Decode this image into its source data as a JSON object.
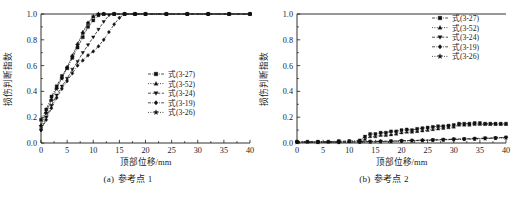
{
  "figure": {
    "panels": [
      {
        "id": "panel-a",
        "caption_tag": "(a)",
        "caption_text": "参考点 1",
        "chart_data": {
          "type": "line",
          "title": "",
          "xlabel": "顶部位移/mm",
          "ylabel": "损伤判断指数",
          "xlim": [
            0,
            40
          ],
          "ylim": [
            0.0,
            1.0
          ],
          "xticks": [
            0,
            5,
            10,
            15,
            20,
            25,
            30,
            35,
            40
          ],
          "yticks": [
            0.0,
            0.2,
            0.4,
            0.6,
            0.8,
            1.0
          ],
          "xtick_labels": [
            "0",
            "5",
            "10",
            "15",
            "20",
            "25",
            "30",
            "35",
            "40"
          ],
          "ytick_labels": [
            "0.0",
            "0.2",
            "0.4",
            "0.6",
            "0.8",
            "1.0"
          ],
          "grid": false,
          "legend_position": "center-right",
          "series": [
            {
              "name": "式(3-27)",
              "marker": "square",
              "linestyle": "dash-dot",
              "x": [
                0,
                1,
                2,
                3,
                4,
                5,
                6,
                7,
                8,
                9,
                10,
                11,
                12,
                14,
                16,
                18,
                20,
                24,
                28,
                32,
                36,
                40
              ],
              "y": [
                0.18,
                0.26,
                0.36,
                0.44,
                0.52,
                0.58,
                0.66,
                0.74,
                0.82,
                0.9,
                0.95,
                0.99,
                1.0,
                1.0,
                1.0,
                1.0,
                1.0,
                1.0,
                1.0,
                1.0,
                1.0,
                1.0
              ]
            },
            {
              "name": "式(3-52)",
              "marker": "triangle-up",
              "linestyle": "dotted",
              "x": [
                0,
                1,
                2,
                3,
                4,
                5,
                6,
                7,
                8,
                9,
                10,
                11,
                12,
                14,
                16,
                18,
                20,
                24,
                28,
                32,
                36,
                40
              ],
              "y": [
                0.14,
                0.24,
                0.34,
                0.43,
                0.51,
                0.59,
                0.68,
                0.77,
                0.86,
                0.93,
                0.98,
                1.0,
                1.0,
                1.0,
                1.0,
                1.0,
                1.0,
                1.0,
                1.0,
                1.0,
                1.0,
                1.0
              ]
            },
            {
              "name": "式(3-24)",
              "marker": "triangle-down",
              "linestyle": "dashed",
              "x": [
                0,
                1,
                2,
                3,
                4,
                5,
                6,
                7,
                8,
                9,
                10,
                11,
                12,
                13,
                14,
                16,
                18,
                20,
                24,
                28,
                32,
                36,
                40
              ],
              "y": [
                0.1,
                0.2,
                0.29,
                0.37,
                0.44,
                0.5,
                0.57,
                0.63,
                0.7,
                0.76,
                0.82,
                0.88,
                0.94,
                0.99,
                1.0,
                1.0,
                1.0,
                1.0,
                1.0,
                1.0,
                1.0,
                1.0,
                1.0
              ]
            },
            {
              "name": "式(3-19)",
              "marker": "diamond",
              "linestyle": "dash-dot",
              "x": [
                0,
                1,
                2,
                3,
                4,
                5,
                6,
                7,
                8,
                9,
                10,
                11,
                12,
                13,
                14,
                15,
                16,
                18,
                20,
                24,
                28,
                32,
                36,
                40
              ],
              "y": [
                0.1,
                0.18,
                0.27,
                0.35,
                0.42,
                0.48,
                0.54,
                0.6,
                0.64,
                0.68,
                0.71,
                0.75,
                0.8,
                0.86,
                0.92,
                0.97,
                1.0,
                1.0,
                1.0,
                1.0,
                1.0,
                1.0,
                1.0,
                1.0
              ]
            },
            {
              "name": "式(3-26)",
              "marker": "star",
              "linestyle": "dotted",
              "x": [
                0,
                1,
                2,
                3,
                4,
                5,
                6,
                7,
                8,
                9,
                10,
                11,
                12,
                14,
                16,
                18,
                20,
                24,
                28,
                32,
                36,
                40
              ],
              "y": [
                0.13,
                0.23,
                0.33,
                0.42,
                0.5,
                0.58,
                0.67,
                0.76,
                0.85,
                0.93,
                0.98,
                1.0,
                1.0,
                1.0,
                1.0,
                1.0,
                1.0,
                1.0,
                1.0,
                1.0,
                1.0,
                1.0
              ]
            }
          ]
        }
      },
      {
        "id": "panel-b",
        "caption_tag": "(b)",
        "caption_text": "参考点 2",
        "chart_data": {
          "type": "line",
          "title": "",
          "xlabel": "顶部位移/mm",
          "ylabel": "损伤判断指数",
          "xlim": [
            0,
            40
          ],
          "ylim": [
            0.0,
            1.0
          ],
          "xticks": [
            0,
            5,
            10,
            15,
            20,
            25,
            30,
            35,
            40
          ],
          "yticks": [
            0.0,
            0.2,
            0.4,
            0.6,
            0.8,
            1.0
          ],
          "xtick_labels": [
            "0",
            "5",
            "10",
            "15",
            "20",
            "25",
            "30",
            "35",
            "40"
          ],
          "ytick_labels": [
            "0.0",
            "0.2",
            "0.4",
            "0.6",
            "0.8",
            "1.0"
          ],
          "grid": false,
          "legend_position": "top-right",
          "series": [
            {
              "name": "式(3-27)",
              "marker": "square",
              "linestyle": "dash-dot",
              "x": [
                0,
                2,
                4,
                6,
                8,
                10,
                12,
                13,
                14,
                15,
                16,
                17,
                18,
                19,
                20,
                21,
                22,
                23,
                24,
                25,
                26,
                27,
                28,
                29,
                30,
                31,
                32,
                33,
                34,
                35,
                36,
                37,
                38,
                39,
                40
              ],
              "y": [
                0.01,
                0.01,
                0.01,
                0.01,
                0.015,
                0.015,
                0.02,
                0.05,
                0.07,
                0.07,
                0.08,
                0.08,
                0.09,
                0.09,
                0.1,
                0.105,
                0.1,
                0.11,
                0.115,
                0.12,
                0.125,
                0.13,
                0.13,
                0.135,
                0.14,
                0.15,
                0.15,
                0.15,
                0.155,
                0.155,
                0.15,
                0.15,
                0.15,
                0.15,
                0.15
              ]
            },
            {
              "name": "式(3-52)",
              "marker": "triangle-up",
              "linestyle": "dotted",
              "x": [
                0,
                2,
                4,
                6,
                8,
                10,
                12,
                13,
                14,
                15,
                16,
                17,
                18,
                19,
                20,
                21,
                22,
                23,
                24,
                25,
                26,
                27,
                28,
                29,
                30,
                31,
                32,
                33,
                34,
                35,
                36,
                37,
                38,
                39,
                40
              ],
              "y": [
                0.01,
                0.01,
                0.01,
                0.01,
                0.012,
                0.012,
                0.015,
                0.03,
                0.05,
                0.05,
                0.06,
                0.06,
                0.065,
                0.07,
                0.08,
                0.085,
                0.085,
                0.09,
                0.095,
                0.1,
                0.105,
                0.11,
                0.115,
                0.12,
                0.125,
                0.14,
                0.14,
                0.14,
                0.145,
                0.145,
                0.145,
                0.145,
                0.145,
                0.145,
                0.145
              ]
            },
            {
              "name": "式(3-24)",
              "marker": "triangle-down",
              "linestyle": "dashed",
              "x": [
                0,
                4,
                8,
                12,
                14,
                16,
                18,
                20,
                22,
                24,
                26,
                28,
                30,
                32,
                34,
                36,
                38,
                40
              ],
              "y": [
                0.008,
                0.008,
                0.008,
                0.01,
                0.012,
                0.014,
                0.015,
                0.018,
                0.02,
                0.022,
                0.025,
                0.027,
                0.03,
                0.032,
                0.035,
                0.038,
                0.04,
                0.045
              ]
            },
            {
              "name": "式(3-19)",
              "marker": "diamond",
              "linestyle": "dash-dot",
              "x": [
                0,
                4,
                8,
                12,
                14,
                16,
                18,
                20,
                22,
                24,
                26,
                28,
                30,
                32,
                34,
                36,
                38,
                40
              ],
              "y": [
                0.006,
                0.006,
                0.006,
                0.008,
                0.01,
                0.012,
                0.013,
                0.016,
                0.018,
                0.02,
                0.022,
                0.025,
                0.028,
                0.03,
                0.032,
                0.035,
                0.038,
                0.042
              ]
            },
            {
              "name": "式(3-26)",
              "marker": "star",
              "linestyle": "dotted",
              "x": [
                0,
                4,
                8,
                12,
                14,
                16,
                18,
                20,
                22,
                24,
                26,
                28,
                30,
                32,
                34,
                36,
                38,
                40
              ],
              "y": [
                0.005,
                0.005,
                0.005,
                0.007,
                0.009,
                0.011,
                0.012,
                0.015,
                0.017,
                0.019,
                0.021,
                0.024,
                0.027,
                0.029,
                0.031,
                0.034,
                0.037,
                0.04
              ]
            }
          ]
        }
      }
    ]
  }
}
